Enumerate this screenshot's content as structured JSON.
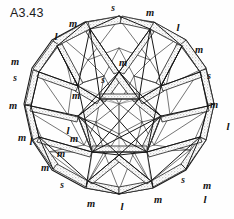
{
  "figure": {
    "caption": "A3.43",
    "title": "A3.43",
    "background_color": "#fefefe",
    "ink_color": "#141414",
    "shading_color": "#9a9a9a",
    "type": "polyhedral-wireframe-sphere",
    "center": {
      "x": 119,
      "y": 112
    },
    "radius_x": 99,
    "radius_y": 95
  },
  "legend": {
    "strut_lengths": [
      {
        "code": "l",
        "meaning": "long strut"
      },
      {
        "code": "m",
        "meaning": "medium strut"
      },
      {
        "code": "s",
        "meaning": "short strut"
      }
    ]
  },
  "labels": [
    {
      "text": "s",
      "x": 113,
      "y": 9,
      "size": "sz-s"
    },
    {
      "text": "m",
      "x": 150,
      "y": 13,
      "size": ""
    },
    {
      "text": "m",
      "x": 73,
      "y": 24,
      "size": ""
    },
    {
      "text": "l",
      "x": 56,
      "y": 36,
      "size": "sz-l"
    },
    {
      "text": "l",
      "x": 178,
      "y": 27,
      "size": "sz-l"
    },
    {
      "text": "m",
      "x": 199,
      "y": 50,
      "size": ""
    },
    {
      "text": "m",
      "x": 123,
      "y": 63,
      "size": ""
    },
    {
      "text": "m",
      "x": 15,
      "y": 62,
      "size": ""
    },
    {
      "text": "s",
      "x": 15,
      "y": 79,
      "size": "sz-s"
    },
    {
      "text": "s",
      "x": 209,
      "y": 77,
      "size": "sz-s"
    },
    {
      "text": "s",
      "x": 103,
      "y": 81,
      "size": "sz-s"
    },
    {
      "text": "m",
      "x": 76,
      "y": 96,
      "size": ""
    },
    {
      "text": "m",
      "x": 13,
      "y": 106,
      "size": ""
    },
    {
      "text": "m",
      "x": 214,
      "y": 105,
      "size": ""
    },
    {
      "text": "l",
      "x": 228,
      "y": 126,
      "size": "sz-l"
    },
    {
      "text": "m",
      "x": 22,
      "y": 138,
      "size": ""
    },
    {
      "text": "m",
      "x": 74,
      "y": 139,
      "size": ""
    },
    {
      "text": "l",
      "x": 31,
      "y": 141,
      "size": "sz-l"
    },
    {
      "text": "m",
      "x": 61,
      "y": 154,
      "size": ""
    },
    {
      "text": "m",
      "x": 45,
      "y": 168,
      "size": ""
    },
    {
      "text": "l",
      "x": 68,
      "y": 130,
      "size": "sz-l"
    },
    {
      "text": "s",
      "x": 62,
      "y": 186,
      "size": "sz-s"
    },
    {
      "text": "s",
      "x": 183,
      "y": 181,
      "size": "sz-s"
    },
    {
      "text": "m",
      "x": 91,
      "y": 204,
      "size": ""
    },
    {
      "text": "l",
      "x": 122,
      "y": 206,
      "size": "sz-l"
    },
    {
      "text": "m",
      "x": 158,
      "y": 200,
      "size": ""
    },
    {
      "text": "m",
      "x": 207,
      "y": 186,
      "size": ""
    },
    {
      "text": "l",
      "x": 205,
      "y": 199,
      "size": "sz-l"
    }
  ]
}
